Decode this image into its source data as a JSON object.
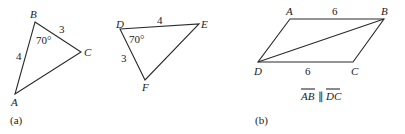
{
  "figure_a": {
    "caption": "(a)",
    "triangle_abc": {
      "vertices": [
        "A",
        "B",
        "C"
      ],
      "side_ab": "4",
      "side_bc": "3",
      "angle_b": "70°"
    },
    "triangle_def": {
      "vertices": [
        "D",
        "E",
        "F"
      ],
      "side_de": "4",
      "side_df": "3",
      "angle_d": "70°"
    }
  },
  "figure_b": {
    "caption": "(b)",
    "parallelogram": {
      "vertices": [
        "A",
        "B",
        "C",
        "D"
      ],
      "side_ab": "6",
      "side_dc": "6",
      "diagonal": "DB"
    },
    "statement": {
      "seg1": "AB",
      "parallel_symbol": "∥",
      "seg2": "DC"
    }
  }
}
